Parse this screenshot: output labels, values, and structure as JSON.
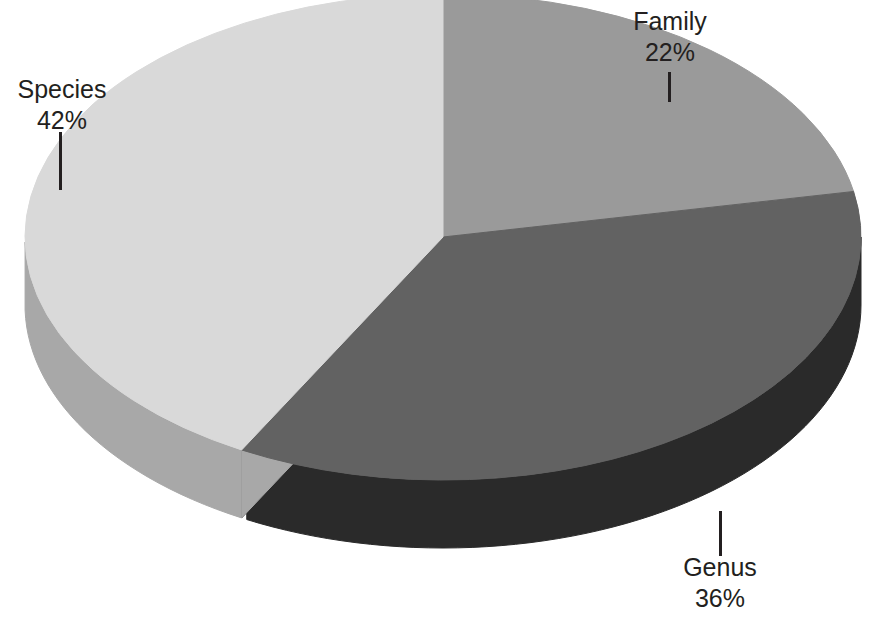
{
  "chart_data": {
    "type": "pie",
    "title": "",
    "subtitle": "",
    "xlabel": "",
    "ylabel": "",
    "three_d": true,
    "legend_position": "none",
    "grid": false,
    "labels_show_percent": true,
    "start_angle_deg": 0,
    "direction": "clockwise",
    "categories": [
      "Family",
      "Genus",
      "Species"
    ],
    "values": [
      22,
      36,
      42
    ],
    "value_labels": [
      "22%",
      "36%",
      "42%"
    ],
    "colors": [
      "#9a9a9a",
      "#626262",
      "#d9d9d9"
    ],
    "side_colors": [
      "#6e6e6e",
      "#2a2a2a",
      "#a8a8a8"
    ],
    "slices": [
      {
        "name": "Family",
        "value": 22,
        "value_label": "22%",
        "color": "#9a9a9a",
        "side_color": "#6e6e6e",
        "label_name": "Family",
        "label_value": "22%"
      },
      {
        "name": "Genus",
        "value": 36,
        "value_label": "36%",
        "color": "#626262",
        "side_color": "#2a2a2a",
        "label_name": "Genus",
        "label_value": "36%"
      },
      {
        "name": "Species",
        "value": 42,
        "value_label": "42%",
        "color": "#d9d9d9",
        "side_color": "#a8a8a8",
        "label_name": "Species",
        "label_value": "42%"
      }
    ]
  },
  "canvas": {
    "background": "#ffffff",
    "label_color": "#231f20",
    "leader_color": "#231f20"
  },
  "labels": {
    "family": {
      "name": "Family",
      "value": "22%"
    },
    "genus": {
      "name": "Genus",
      "value": "36%"
    },
    "species": {
      "name": "Species",
      "value": "42%"
    }
  }
}
